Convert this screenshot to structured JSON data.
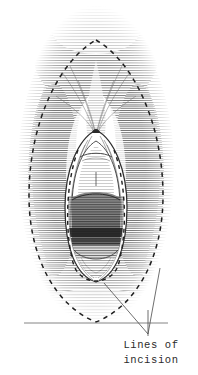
{
  "figure": {
    "kind": "anatomical-line-drawing",
    "technique": "pen-and-ink horizontal hatching",
    "background_color": "#ffffff",
    "ink_color": "#2b2b2b",
    "width_px": 198,
    "height_px": 375,
    "caption": {
      "line1": "Lines of",
      "line2": "incision",
      "full_text": "Lines of incision"
    },
    "annotations": {
      "outer_incision_label": "Lines of incision",
      "leader_vertex_x": 148,
      "leader_vertex_y": 334
    },
    "elements": {
      "outer_dashed_ellipse": "outer line of incision",
      "inner_dashed_ellipse": "inner line of incision",
      "central_structure": "shaded introital opening",
      "hatched_field": "surrounding tissue rendered in horizontal hatching",
      "baseline": "horizontal ground line"
    },
    "colors": {
      "ink": "#2b2b2b",
      "hatch_light": "#9a9a9a",
      "hatch_mid": "#6e6e6e",
      "hatch_dark": "#3a3a3a",
      "shadow_fill": "#5a5a5a",
      "paper": "#ffffff"
    }
  }
}
